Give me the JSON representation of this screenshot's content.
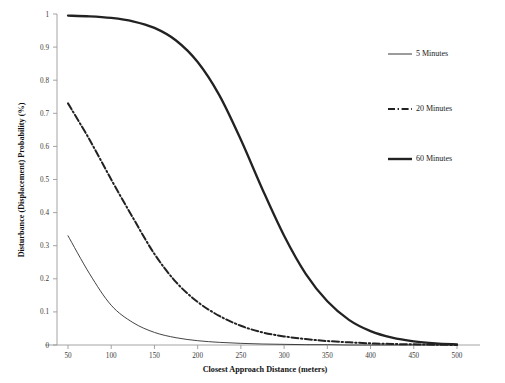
{
  "chart_data": {
    "type": "line",
    "title": "",
    "xlabel": "Closest Approach  Distance (meters)",
    "ylabel": "Disturbance  (Displacement) Probability  (%)",
    "xlim": [
      25,
      520
    ],
    "ylim": [
      0,
      1
    ],
    "grid": false,
    "legend_position": "right",
    "x_ticks": [
      50,
      100,
      150,
      200,
      250,
      300,
      350,
      400,
      450,
      500
    ],
    "x_tick_labels": [
      "50",
      "100",
      "150",
      "200",
      "250",
      "300",
      "350",
      "400",
      "450",
      "500"
    ],
    "y_ticks": [
      0,
      0.1,
      0.2,
      0.3,
      0.4,
      0.5,
      0.6,
      0.7,
      0.8,
      0.9,
      1
    ],
    "y_tick_labels": [
      "0",
      "0.1",
      "0.2",
      "0.3",
      "0.4",
      "0.5",
      "0.6",
      "0.7",
      "0.8",
      "0.9",
      "1"
    ],
    "x": [
      50,
      75,
      100,
      125,
      150,
      175,
      200,
      225,
      250,
      275,
      300,
      325,
      350,
      375,
      400,
      425,
      450,
      475,
      500
    ],
    "series": [
      {
        "name": "5 Minutes",
        "style": "thin-solid",
        "color": "#222222",
        "values": [
          0.33,
          0.215,
          0.12,
          0.068,
          0.038,
          0.022,
          0.013,
          0.008,
          0.005,
          0.003,
          0.002,
          0.001,
          0.001,
          0.0,
          0.0,
          0.0,
          0.0,
          0.0,
          0.0
        ]
      },
      {
        "name": "20 Minutes",
        "style": "dash-dot",
        "color": "#222222",
        "values": [
          0.73,
          0.62,
          0.5,
          0.385,
          0.275,
          0.19,
          0.13,
          0.088,
          0.058,
          0.038,
          0.026,
          0.018,
          0.012,
          0.008,
          0.005,
          0.003,
          0.002,
          0.001,
          0.0
        ]
      },
      {
        "name": "60 Minutes",
        "style": "thick-solid",
        "color": "#222222",
        "values": [
          0.995,
          0.993,
          0.988,
          0.978,
          0.958,
          0.92,
          0.855,
          0.755,
          0.62,
          0.47,
          0.33,
          0.215,
          0.132,
          0.076,
          0.042,
          0.022,
          0.011,
          0.005,
          0.002
        ]
      }
    ],
    "legend": [
      {
        "label": "5 Minutes",
        "style": "thin-solid"
      },
      {
        "label": "20 Minutes",
        "style": "dash-dot"
      },
      {
        "label": "60 Minutes",
        "style": "thick-solid"
      }
    ]
  }
}
